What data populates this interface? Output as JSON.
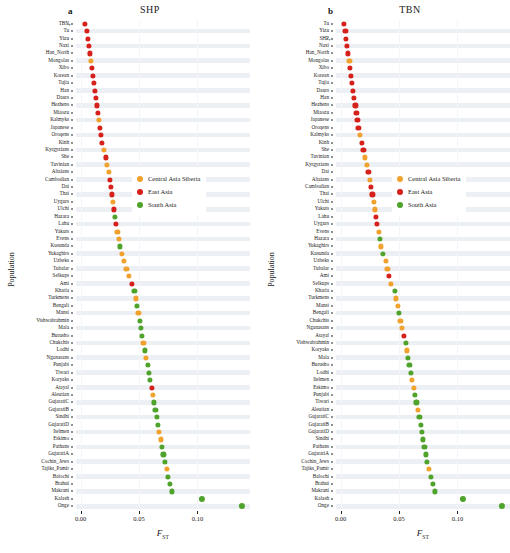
{
  "figure": {
    "panels": [
      {
        "letter": "a",
        "title": "SHP"
      },
      {
        "letter": "b",
        "title": "TBN"
      }
    ],
    "axis": {
      "ylabel": "Population",
      "xlabel": "F",
      "xlabel_sub": "ST",
      "xticks": [
        "0.00",
        "0.05",
        "0.10"
      ],
      "xtickvalues": [
        0.0,
        0.05,
        0.1
      ],
      "xlim": [
        -0.004,
        0.145
      ]
    },
    "legend": {
      "position": "center-right",
      "items": [
        {
          "label": "Central Asia Siberia",
          "color": "#f0a12e"
        },
        {
          "label": "East Asia",
          "color": "#d6201b"
        },
        {
          "label": "South Asia",
          "color": "#4fa32a"
        }
      ]
    },
    "colors": {
      "central_asia_siberia": "#f0a12e",
      "east_asia": "#d6201b",
      "south_asia": "#4fa32a",
      "stripe": "#eceff3",
      "background": "#ffffff"
    }
  },
  "chart_data": [
    {
      "type": "scatter",
      "title": "SHP",
      "panel": "a",
      "xlabel": "F_ST",
      "ylabel": "Population",
      "xlim": [
        -0.004,
        0.145
      ],
      "grid": true,
      "legend": [
        "Central Asia Siberia",
        "East Asia",
        "South Asia"
      ],
      "annotation": {
        "population": "TBN",
        "marker": "arrow"
      },
      "points": [
        {
          "population": "TBN",
          "value": 0.0035,
          "group": "East Asia"
        },
        {
          "population": "Tu",
          "value": 0.0055,
          "group": "East Asia"
        },
        {
          "population": "Yizu",
          "value": 0.0065,
          "group": "East Asia"
        },
        {
          "population": "Naxi",
          "value": 0.0072,
          "group": "East Asia"
        },
        {
          "population": "Han_North",
          "value": 0.008,
          "group": "East Asia"
        },
        {
          "population": "Mongolas",
          "value": 0.009,
          "group": "Central Asia Siberia"
        },
        {
          "population": "Xibo",
          "value": 0.0098,
          "group": "East Asia"
        },
        {
          "population": "Korean",
          "value": 0.0107,
          "group": "East Asia"
        },
        {
          "population": "Tujia",
          "value": 0.0113,
          "group": "East Asia"
        },
        {
          "population": "Han",
          "value": 0.0119,
          "group": "East Asia"
        },
        {
          "population": "Daurs",
          "value": 0.0128,
          "group": "East Asia"
        },
        {
          "population": "Hezhens",
          "value": 0.0137,
          "group": "East Asia"
        },
        {
          "population": "Miaozu",
          "value": 0.0145,
          "group": "East Asia"
        },
        {
          "population": "Kalmyks",
          "value": 0.0155,
          "group": "Central Asia Siberia"
        },
        {
          "population": "Japanese",
          "value": 0.0162,
          "group": "East Asia"
        },
        {
          "population": "Oroqens",
          "value": 0.017,
          "group": "East Asia"
        },
        {
          "population": "Kinh",
          "value": 0.018,
          "group": "East Asia"
        },
        {
          "population": "Kyrgyzians",
          "value": 0.02,
          "group": "Central Asia Siberia"
        },
        {
          "population": "She",
          "value": 0.0213,
          "group": "East Asia"
        },
        {
          "population": "Tuvinian",
          "value": 0.0226,
          "group": "Central Asia Siberia"
        },
        {
          "population": "Altaians",
          "value": 0.024,
          "group": "Central Asia Siberia"
        },
        {
          "population": "Cambodian",
          "value": 0.0252,
          "group": "East Asia"
        },
        {
          "population": "Dai",
          "value": 0.0261,
          "group": "East Asia"
        },
        {
          "population": "Thai",
          "value": 0.0269,
          "group": "East Asia"
        },
        {
          "population": "Uygurs",
          "value": 0.0278,
          "group": "Central Asia Siberia"
        },
        {
          "population": "Ulchi",
          "value": 0.0286,
          "group": "East Asia"
        },
        {
          "population": "Hazara",
          "value": 0.0294,
          "group": "South Asia"
        },
        {
          "population": "Lahu",
          "value": 0.0303,
          "group": "East Asia"
        },
        {
          "population": "Yakuts",
          "value": 0.0314,
          "group": "Central Asia Siberia"
        },
        {
          "population": "Evens",
          "value": 0.0326,
          "group": "Central Asia Siberia"
        },
        {
          "population": "Kusunda",
          "value": 0.0337,
          "group": "South Asia"
        },
        {
          "population": "Yukaghirs",
          "value": 0.035,
          "group": "Central Asia Siberia"
        },
        {
          "population": "Uzbeks",
          "value": 0.0372,
          "group": "Central Asia Siberia"
        },
        {
          "population": "Tubalar",
          "value": 0.0392,
          "group": "Central Asia Siberia"
        },
        {
          "population": "Selkups",
          "value": 0.0413,
          "group": "Central Asia Siberia"
        },
        {
          "population": "Ami",
          "value": 0.044,
          "group": "East Asia"
        },
        {
          "population": "Kharia",
          "value": 0.046,
          "group": "South Asia"
        },
        {
          "population": "Turkmens",
          "value": 0.0472,
          "group": "Central Asia Siberia"
        },
        {
          "population": "Bengali",
          "value": 0.0484,
          "group": "South Asia"
        },
        {
          "population": "Mansi",
          "value": 0.0494,
          "group": "Central Asia Siberia"
        },
        {
          "population": "Vishwabrahmin",
          "value": 0.0506,
          "group": "South Asia"
        },
        {
          "population": "Mala",
          "value": 0.0517,
          "group": "South Asia"
        },
        {
          "population": "Burusho",
          "value": 0.0527,
          "group": "South Asia"
        },
        {
          "population": "Chukchis",
          "value": 0.0537,
          "group": "Central Asia Siberia"
        },
        {
          "population": "Lodhi",
          "value": 0.0548,
          "group": "South Asia"
        },
        {
          "population": "Nganasans",
          "value": 0.0561,
          "group": "Central Asia Siberia"
        },
        {
          "population": "Punjabi",
          "value": 0.0573,
          "group": "South Asia"
        },
        {
          "population": "Tiwari",
          "value": 0.0582,
          "group": "South Asia"
        },
        {
          "population": "Koryaks",
          "value": 0.0592,
          "group": "South Asia"
        },
        {
          "population": "Atayal",
          "value": 0.061,
          "group": "East Asia"
        },
        {
          "population": "Aleutian",
          "value": 0.0619,
          "group": "Central Asia Siberia"
        },
        {
          "population": "GujaratiC",
          "value": 0.063,
          "group": "South Asia"
        },
        {
          "population": "GujaratiB",
          "value": 0.064,
          "group": "South Asia"
        },
        {
          "population": "Sindhi",
          "value": 0.065,
          "group": "South Asia"
        },
        {
          "population": "GujaratiD",
          "value": 0.0659,
          "group": "South Asia"
        },
        {
          "population": "Itelmen",
          "value": 0.0673,
          "group": "Central Asia Siberia"
        },
        {
          "population": "Eskimo",
          "value": 0.0686,
          "group": "Central Asia Siberia"
        },
        {
          "population": "Pathans",
          "value": 0.0699,
          "group": "South Asia"
        },
        {
          "population": "GujaratiA",
          "value": 0.0709,
          "group": "South Asia"
        },
        {
          "population": "Cochin_Jews",
          "value": 0.0719,
          "group": "South Asia"
        },
        {
          "population": "Tajiks_Pamir",
          "value": 0.0736,
          "group": "Central Asia Siberia"
        },
        {
          "population": "Balochi",
          "value": 0.075,
          "group": "South Asia"
        },
        {
          "population": "Brahui",
          "value": 0.0762,
          "group": "South Asia"
        },
        {
          "population": "Makrani",
          "value": 0.0778,
          "group": "South Asia"
        },
        {
          "population": "Kalash",
          "value": 0.104,
          "group": "South Asia"
        },
        {
          "population": "Onge",
          "value": 0.138,
          "group": "South Asia"
        }
      ]
    },
    {
      "type": "scatter",
      "title": "TBN",
      "panel": "b",
      "xlabel": "F_ST",
      "ylabel": "Population",
      "xlim": [
        -0.004,
        0.145
      ],
      "grid": true,
      "legend": [
        "Central Asia Siberia",
        "East Asia",
        "South Asia"
      ],
      "annotation": {
        "population": "SHP",
        "marker": "arrow"
      },
      "points": [
        {
          "population": "Tu",
          "value": 0.003,
          "group": "East Asia"
        },
        {
          "population": "Yizu",
          "value": 0.004,
          "group": "East Asia"
        },
        {
          "population": "SHP",
          "value": 0.0048,
          "group": "East Asia"
        },
        {
          "population": "Naxi",
          "value": 0.0056,
          "group": "East Asia"
        },
        {
          "population": "Han_North",
          "value": 0.0064,
          "group": "East Asia"
        },
        {
          "population": "Mongolas",
          "value": 0.0074,
          "group": "Central Asia Siberia"
        },
        {
          "population": "Xibo",
          "value": 0.0082,
          "group": "East Asia"
        },
        {
          "population": "Korean",
          "value": 0.0091,
          "group": "East Asia"
        },
        {
          "population": "Tujia",
          "value": 0.0098,
          "group": "East Asia"
        },
        {
          "population": "Daurs",
          "value": 0.0107,
          "group": "East Asia"
        },
        {
          "population": "Han",
          "value": 0.0115,
          "group": "East Asia"
        },
        {
          "population": "Hezhens",
          "value": 0.0126,
          "group": "East Asia"
        },
        {
          "population": "Miaozu",
          "value": 0.0134,
          "group": "East Asia"
        },
        {
          "population": "Japanese",
          "value": 0.0144,
          "group": "East Asia"
        },
        {
          "population": "Oroqens",
          "value": 0.0152,
          "group": "East Asia"
        },
        {
          "population": "Kalmyks",
          "value": 0.0163,
          "group": "Central Asia Siberia"
        },
        {
          "population": "Kinh",
          "value": 0.018,
          "group": "East Asia"
        },
        {
          "population": "She",
          "value": 0.0195,
          "group": "East Asia"
        },
        {
          "population": "Tuvinian",
          "value": 0.021,
          "group": "Central Asia Siberia"
        },
        {
          "population": "Kyrgyzians",
          "value": 0.0222,
          "group": "Central Asia Siberia"
        },
        {
          "population": "Dai",
          "value": 0.0237,
          "group": "East Asia"
        },
        {
          "population": "Altaians",
          "value": 0.0248,
          "group": "Central Asia Siberia"
        },
        {
          "population": "Cambodian",
          "value": 0.0261,
          "group": "East Asia"
        },
        {
          "population": "Thai",
          "value": 0.0272,
          "group": "East Asia"
        },
        {
          "population": "Ulchi",
          "value": 0.0283,
          "group": "Central Asia Siberia"
        },
        {
          "population": "Yakuts",
          "value": 0.0292,
          "group": "Central Asia Siberia"
        },
        {
          "population": "Lahu",
          "value": 0.0302,
          "group": "East Asia"
        },
        {
          "population": "Uygurs",
          "value": 0.0312,
          "group": "East Asia"
        },
        {
          "population": "Evens",
          "value": 0.0324,
          "group": "Central Asia Siberia"
        },
        {
          "population": "Hazara",
          "value": 0.0335,
          "group": "South Asia"
        },
        {
          "population": "Yukaghirs",
          "value": 0.0346,
          "group": "Central Asia Siberia"
        },
        {
          "population": "Kusunda",
          "value": 0.036,
          "group": "South Asia"
        },
        {
          "population": "Uzbeks",
          "value": 0.0384,
          "group": "Central Asia Siberia"
        },
        {
          "population": "Tubalar",
          "value": 0.04,
          "group": "Central Asia Siberia"
        },
        {
          "population": "Ami",
          "value": 0.0416,
          "group": "East Asia"
        },
        {
          "population": "Selkups",
          "value": 0.0428,
          "group": "Central Asia Siberia"
        },
        {
          "population": "Kharia",
          "value": 0.0462,
          "group": "South Asia"
        },
        {
          "population": "Turkmens",
          "value": 0.0474,
          "group": "Central Asia Siberia"
        },
        {
          "population": "Mansi",
          "value": 0.0487,
          "group": "Central Asia Siberia"
        },
        {
          "population": "Bengali",
          "value": 0.05,
          "group": "South Asia"
        },
        {
          "population": "Chukchis",
          "value": 0.0512,
          "group": "Central Asia Siberia"
        },
        {
          "population": "Nganasans",
          "value": 0.0524,
          "group": "Central Asia Siberia"
        },
        {
          "population": "Atayal",
          "value": 0.0543,
          "group": "East Asia"
        },
        {
          "population": "Vishwabrahmin",
          "value": 0.0556,
          "group": "South Asia"
        },
        {
          "population": "Koryaks",
          "value": 0.0566,
          "group": "Central Asia Siberia"
        },
        {
          "population": "Mala",
          "value": 0.0578,
          "group": "South Asia"
        },
        {
          "population": "Burusho",
          "value": 0.0588,
          "group": "South Asia"
        },
        {
          "population": "Lodhi",
          "value": 0.06,
          "group": "South Asia"
        },
        {
          "population": "Itelmen",
          "value": 0.0613,
          "group": "Central Asia Siberia"
        },
        {
          "population": "Eskimo",
          "value": 0.0625,
          "group": "Central Asia Siberia"
        },
        {
          "population": "Punjabi",
          "value": 0.0637,
          "group": "South Asia"
        },
        {
          "population": "Tiwari",
          "value": 0.0648,
          "group": "South Asia"
        },
        {
          "population": "Aleutian",
          "value": 0.066,
          "group": "Central Asia Siberia"
        },
        {
          "population": "GujaratiC",
          "value": 0.0675,
          "group": "South Asia"
        },
        {
          "population": "GujaratiB",
          "value": 0.0686,
          "group": "South Asia"
        },
        {
          "population": "GujaratiD",
          "value": 0.0696,
          "group": "South Asia"
        },
        {
          "population": "Sindhi",
          "value": 0.0706,
          "group": "South Asia"
        },
        {
          "population": "Pathans",
          "value": 0.0717,
          "group": "South Asia"
        },
        {
          "population": "GujaratiA",
          "value": 0.0728,
          "group": "South Asia"
        },
        {
          "population": "Cochin_Jews",
          "value": 0.074,
          "group": "South Asia"
        },
        {
          "population": "Tajiks_Pamir",
          "value": 0.0758,
          "group": "Central Asia Siberia"
        },
        {
          "population": "Balochi",
          "value": 0.0775,
          "group": "South Asia"
        },
        {
          "population": "Brahui",
          "value": 0.079,
          "group": "South Asia"
        },
        {
          "population": "Makrani",
          "value": 0.0808,
          "group": "South Asia"
        },
        {
          "population": "Kalash",
          "value": 0.1045,
          "group": "South Asia"
        },
        {
          "population": "Onge",
          "value": 0.138,
          "group": "South Asia"
        }
      ]
    }
  ]
}
